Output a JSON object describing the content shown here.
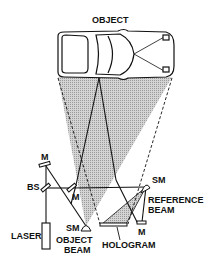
{
  "diagram": {
    "labels": {
      "object": "OBJECT",
      "mirror_top": "M",
      "beam_splitter": "BS",
      "mirror_mid": "M",
      "laser": "LASER",
      "sm_object": "SM",
      "object_beam_1": "OBJECT",
      "object_beam_2": "BEAM",
      "sm_reference": "SM",
      "reference_beam_1": "REFERENCE",
      "reference_beam_2": "BEAM",
      "mirror_ref": "M",
      "hologram": "HOLOGRAM"
    },
    "colors": {
      "line": "#111111",
      "shade": "#c8c8c8",
      "background": "#ffffff"
    }
  }
}
